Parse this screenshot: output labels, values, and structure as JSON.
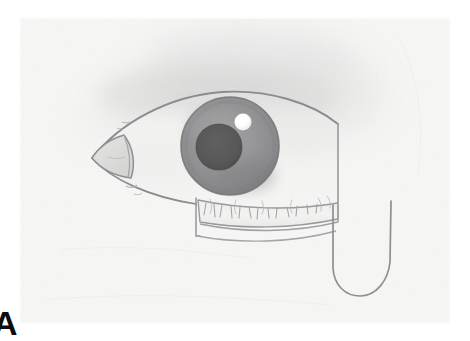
{
  "figure": {
    "domain": "natural-image",
    "medium": "graphite pencil drawing on white paper",
    "panel_label": "A",
    "width": 470,
    "height": 341
  },
  "canvas": {
    "background_color": "#ffffff",
    "paper_color": "#f6f6f5",
    "paper_left": 20,
    "paper_top": 18,
    "paper_width": 430,
    "paper_height": 305
  },
  "palette": {
    "paper": "#f6f6f5",
    "paper_edge": "#fbfbfa",
    "outline": "#8c8c8e",
    "outline_soft": "#a7a7a9",
    "brow_shadow": "#e2e2e1",
    "brow_shadow_deep": "#d6d6d5",
    "sclera": "#f2f2f1",
    "sclera_shade": "#e6e6e5",
    "iris_outer": "#8f8f91",
    "iris_mid": "#9a9a9c",
    "iris_inner": "#8a8a8c",
    "iris_rim": "#7c7c7e",
    "pupil": "#5a5a5a",
    "pupil_edge": "#4e4e4e",
    "highlight": "#ffffff",
    "lid_band": "#ededec",
    "lid_line": "#96969a",
    "caruncle": "#dcdcdb",
    "lash_mark": "#a0a0a3",
    "label_color": "#0d0d0d"
  },
  "geometry": {
    "eye_opening": {
      "inner_corner_x": 92,
      "inner_corner_y": 158,
      "outer_edge_x": 340,
      "top_apex_x": 222,
      "top_apex_y": 92,
      "bottom_y": 205
    },
    "iris": {
      "cx": 230,
      "cy": 146,
      "r": 49
    },
    "pupil": {
      "cx": 219,
      "cy": 147,
      "r": 23
    },
    "highlight": {
      "cx": 243,
      "cy": 122,
      "r": 8
    },
    "lower_lid_band": {
      "left": 196,
      "right": 338,
      "top": 198,
      "bottom": 237
    },
    "hook_curve": {
      "left": 330,
      "right": 392,
      "top": 200,
      "bottom": 295
    }
  },
  "annotations": {
    "brow_shadow_label": "soft graded brow shadow above the lid",
    "lash_marks_label": "short lash strokes along lower lid margin",
    "hook_label": "curved U-shaped pencil line at outer canthus"
  }
}
